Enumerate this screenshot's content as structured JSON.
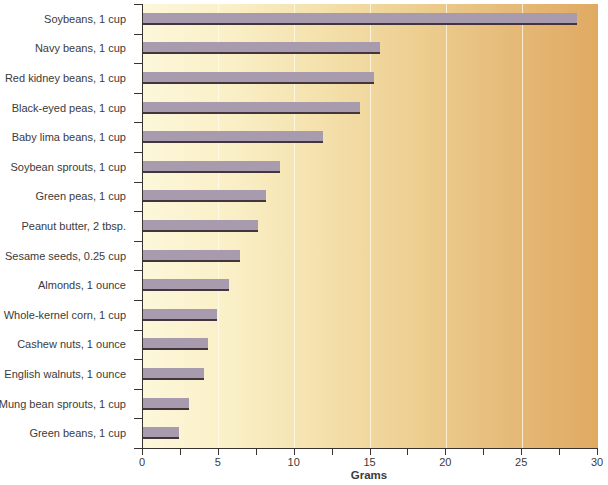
{
  "chart_data": {
    "type": "bar",
    "orientation": "horizontal",
    "title": "",
    "xlabel": "Grams",
    "ylabel": "",
    "xlim": [
      0,
      30
    ],
    "x_major_ticks": [
      0,
      5,
      10,
      15,
      20,
      25,
      30
    ],
    "x_minor_tick_step": 2.5,
    "gridlines_x": [
      5,
      10,
      15,
      20,
      25
    ],
    "grid": "vertical-light",
    "legend": "none",
    "categories": [
      "Soybeans, 1 cup",
      "Navy beans, 1 cup",
      "Red kidney beans, 1 cup",
      "Black-eyed peas, 1 cup",
      "Baby lima beans, 1 cup",
      "Soybean sprouts, 1 cup",
      "Green peas, 1 cup",
      "Peanut butter, 2 tbsp.",
      "Sesame seeds, 0.25 cup",
      "Almonds, 1 ounce",
      "Whole-kernel corn, 1 cup",
      "Cashew nuts, 1 ounce",
      "English walnuts, 1 ounce",
      "Mung bean sprouts, 1 cup",
      "Green beans, 1 cup"
    ],
    "values": [
      28.6,
      15.6,
      15.2,
      14.3,
      11.9,
      9.0,
      8.1,
      7.6,
      6.4,
      5.7,
      4.9,
      4.3,
      4.0,
      3.0,
      2.4
    ]
  },
  "colors": {
    "bar_fill": "#a89bae",
    "bar_edge": "#42353c",
    "plot_bg_left": "#fdf7da",
    "plot_bg_mid": "#eccd8e",
    "plot_bg_right": "#e0aa62",
    "gridline": "rgba(255,252,235,0.75)",
    "axis": "#3a3431",
    "text": "#3b3b3b",
    "page_bg": "#ffffff"
  }
}
